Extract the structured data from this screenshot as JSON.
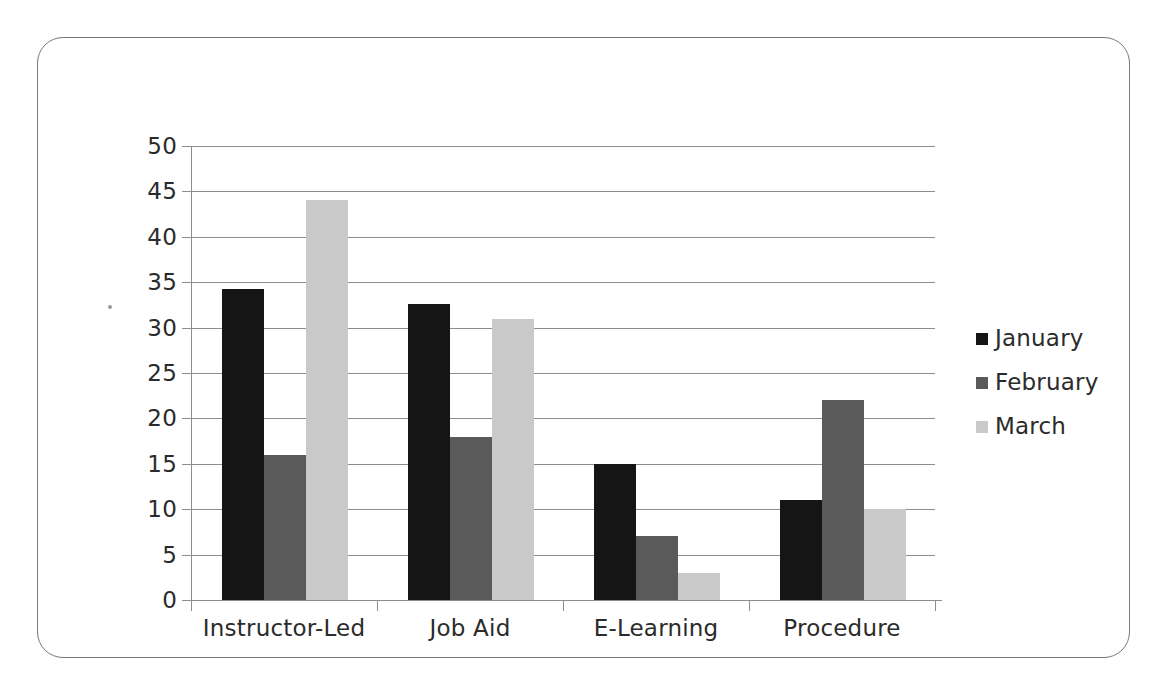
{
  "chart_data": {
    "type": "bar",
    "title": "",
    "subtitle": "",
    "xlabel": "",
    "ylabel": "",
    "categories": [
      "Instructor-Led",
      "Job Aid",
      "E-Learning",
      "Procedure"
    ],
    "series": [
      {
        "name": "January",
        "color": "#151515",
        "values": [
          34.3,
          32.6,
          15,
          11
        ]
      },
      {
        "name": "February",
        "color": "#5a5a5a",
        "values": [
          16,
          18,
          7,
          22
        ]
      },
      {
        "name": "March",
        "color": "#c9c9c9",
        "values": [
          44,
          31,
          3,
          10
        ]
      }
    ],
    "ylim": [
      0,
      50
    ],
    "y_ticks": [
      0,
      5,
      10,
      15,
      20,
      25,
      30,
      35,
      40,
      45,
      50
    ],
    "y_tick_labels": [
      "0",
      "5",
      "10",
      "15",
      "20",
      "25",
      "30",
      "35",
      "40",
      "45",
      "50"
    ],
    "grid": true,
    "grid_axis": "y",
    "legend_position": "right",
    "legend_entries": [
      "January",
      "February",
      "March"
    ],
    "bar_grouping": "grouped"
  },
  "frame": {
    "border_color": "#7a7a7a",
    "background": "#ffffff"
  },
  "axis": {
    "line_color": "#8d8d8d",
    "text_color": "#2b2b2b"
  }
}
